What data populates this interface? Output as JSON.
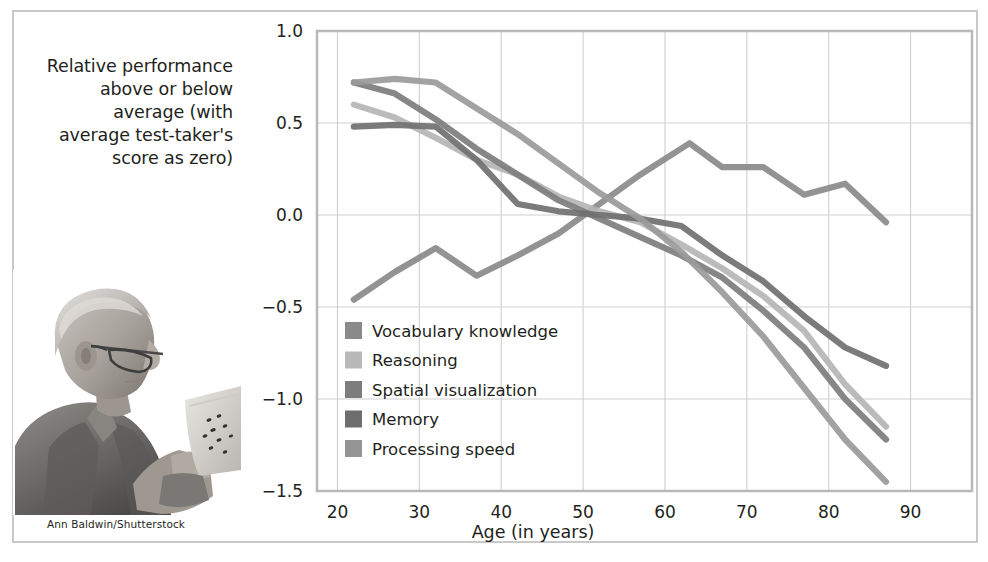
{
  "figure": {
    "credit": "Ann Baldwin/Shutterstock",
    "y_caption_lines": [
      "Relative performance",
      "above or below",
      "average (with",
      "average test-taker's",
      "score as zero)"
    ],
    "photo_alt": "elderly-man-reading-paper-photo"
  },
  "chart_data": {
    "type": "line",
    "title": "",
    "subtitle": "",
    "xlabel": "Age (in years)",
    "ylabel": "Relative performance above or below average (with average test-taker's score as zero)",
    "xlim": [
      17.5,
      97.5
    ],
    "ylim": [
      -1.5,
      1.0
    ],
    "xticks": [
      20,
      30,
      40,
      50,
      60,
      70,
      80,
      90
    ],
    "xtick_labels": [
      "20",
      "30",
      "40",
      "50",
      "60",
      "70",
      "80",
      "90"
    ],
    "yticks": [
      -1.5,
      -1.0,
      -0.5,
      0.0,
      0.5,
      1.0
    ],
    "ytick_labels": [
      "−1.5",
      "−1.0",
      "−0.5",
      "0.0",
      "0.5",
      "1.0"
    ],
    "grid": true,
    "grid_color": "#cfcfcf",
    "legend_position": "lower-left-inside",
    "series": [
      {
        "name": "Vocabulary knowledge",
        "color": "#8a8a8a",
        "x": [
          22,
          27,
          32,
          37,
          42,
          47,
          52,
          57,
          63,
          67,
          72,
          77,
          82,
          87
        ],
        "values": [
          -0.46,
          -0.31,
          -0.18,
          -0.33,
          -0.22,
          -0.1,
          0.06,
          0.22,
          0.39,
          0.26,
          0.26,
          0.11,
          0.17,
          -0.04
        ]
      },
      {
        "name": "Reasoning",
        "color": "#b5b5b5",
        "x": [
          22,
          27,
          32,
          37,
          42,
          47,
          52,
          57,
          62,
          67,
          72,
          77,
          82,
          87
        ],
        "values": [
          0.6,
          0.53,
          0.42,
          0.3,
          0.22,
          0.1,
          0.02,
          -0.04,
          -0.16,
          -0.29,
          -0.44,
          -0.63,
          -0.92,
          -1.15
        ]
      },
      {
        "name": "Spatial visualization",
        "color": "#7d7d7d",
        "x": [
          22,
          27,
          32,
          37,
          42,
          47,
          52,
          57,
          62,
          67,
          72,
          77,
          82,
          87
        ],
        "values": [
          0.72,
          0.66,
          0.52,
          0.36,
          0.22,
          0.08,
          -0.02,
          -0.12,
          -0.22,
          -0.34,
          -0.52,
          -0.72,
          -1.0,
          -1.22
        ]
      },
      {
        "name": "Memory",
        "color": "#707070",
        "x": [
          22,
          27,
          32,
          37,
          42,
          47,
          52,
          57,
          62,
          67,
          72,
          77,
          82,
          87
        ],
        "values": [
          0.48,
          0.49,
          0.48,
          0.3,
          0.06,
          0.02,
          0.0,
          -0.02,
          -0.06,
          -0.22,
          -0.36,
          -0.55,
          -0.72,
          -0.82
        ]
      },
      {
        "name": "Processing speed",
        "color": "#9a9a9a",
        "x": [
          22,
          27,
          32,
          37,
          42,
          47,
          52,
          57,
          62,
          67,
          72,
          77,
          82,
          87
        ],
        "values": [
          0.72,
          0.74,
          0.72,
          0.58,
          0.44,
          0.28,
          0.12,
          -0.02,
          -0.2,
          -0.42,
          -0.66,
          -0.94,
          -1.22,
          -1.45
        ]
      }
    ]
  },
  "legend": {
    "entries": [
      {
        "label": "Vocabulary knowledge",
        "color": "#8a8a8a"
      },
      {
        "label": "Reasoning",
        "color": "#b9b9b9"
      },
      {
        "label": "Spatial visualization",
        "color": "#7d7d7d"
      },
      {
        "label": "Memory",
        "color": "#6e6e6e"
      },
      {
        "label": "Processing speed",
        "color": "#949494"
      }
    ]
  }
}
